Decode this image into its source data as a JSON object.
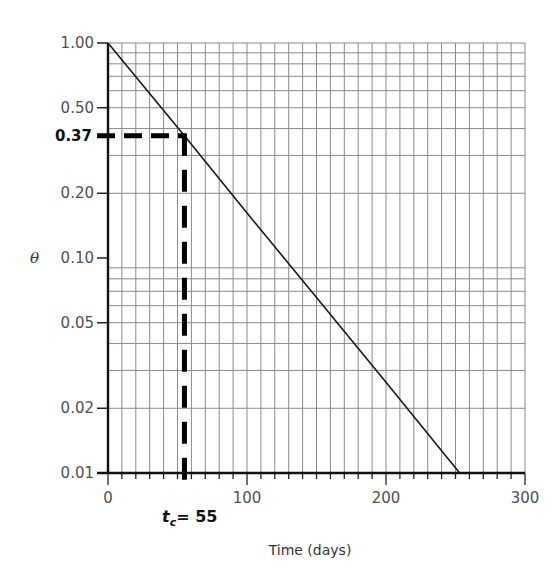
{
  "chart_data": {
    "type": "line",
    "title": "",
    "xlabel": "Time (days)",
    "ylabel": "θ",
    "xscale": "linear",
    "yscale": "log",
    "xlim": [
      0,
      300
    ],
    "ylim": [
      0.01,
      1.0
    ],
    "x_ticks": [
      0,
      100,
      200,
      300
    ],
    "x_tick_labels": [
      "0",
      "100",
      "200",
      "300"
    ],
    "x_minor_grid_step": 10,
    "y_ticks": [
      1.0,
      0.5,
      0.2,
      0.1,
      0.05,
      0.02,
      0.01
    ],
    "y_tick_labels": [
      "1.00",
      "0.50",
      "0.20",
      "0.10",
      "0.05",
      "0.02",
      "0.01"
    ],
    "y_minor_grid": [
      0.9,
      0.8,
      0.7,
      0.6,
      0.5,
      0.4,
      0.3,
      0.2,
      0.09,
      0.08,
      0.07,
      0.06,
      0.05,
      0.04,
      0.03,
      0.02
    ],
    "grid": true,
    "series": [
      {
        "name": "θ = exp(-t / t_c)",
        "x": [
          0,
          55,
          100,
          150,
          200,
          253
        ],
        "y": [
          1.0,
          0.37,
          0.162,
          0.0655,
          0.0264,
          0.01
        ]
      }
    ],
    "annotations": [
      {
        "type": "dashed-hline",
        "y": 0.37,
        "label": "0.37",
        "bold": true
      },
      {
        "type": "dashed-vline",
        "x": 55,
        "label_main": "t",
        "label_sub": "c",
        "label_value": "= 55",
        "bold": true
      }
    ]
  },
  "labels": {
    "xlabel": "Time (days)",
    "ylabel": "θ",
    "y_marker": "0.37",
    "tc_main": "t",
    "tc_sub": "c",
    "tc_value": "= 55"
  }
}
